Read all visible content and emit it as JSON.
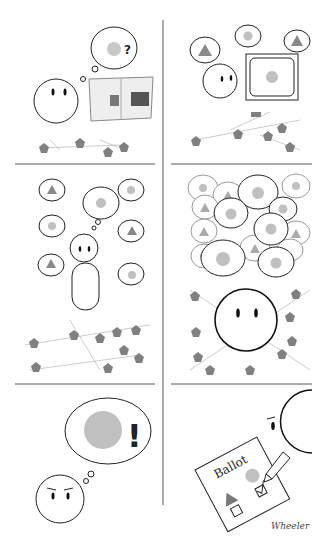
{
  "comic": {
    "panels": [
      {
        "id": 1,
        "description": "Person reads newspaper with a bar chart, thinking of a circle with a question mark",
        "thought_mark": "?"
      },
      {
        "id": 2,
        "description": "Person hears speech bubbles with triangles and circles, watches TV showing a circle"
      },
      {
        "id": 3,
        "description": "Person surrounded by speech bubbles of triangles and circles, thinking of circle"
      },
      {
        "id": 4,
        "description": "Crowd of speech bubbles mostly circles surrounding a large face over neural network"
      },
      {
        "id": 5,
        "description": "Determined person thinking of a big circle with exclamation mark",
        "thought_mark": "!"
      },
      {
        "id": 6,
        "description": "Person marks ballot, checking the circle option",
        "ballot_title": "Ballot"
      }
    ],
    "signature": "Wheeler",
    "colors": {
      "circle": "#b8b8b8",
      "triangle": "#7a7a7a",
      "neuron": "#808080",
      "line": "#222222",
      "divider": "#555555"
    }
  }
}
